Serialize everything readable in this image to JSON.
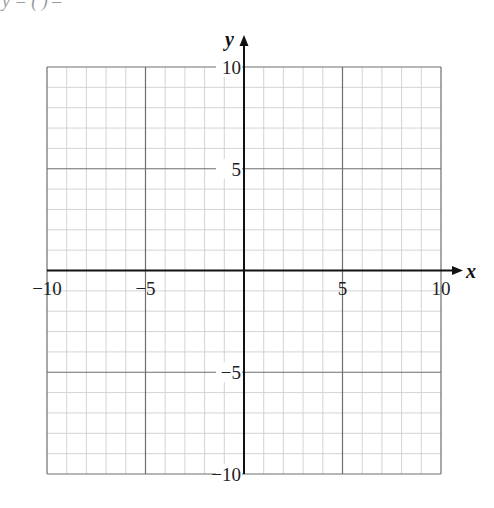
{
  "header": {
    "cropped_text": "y  =   ( )   –  "
  },
  "chart_data": {
    "type": "scatter",
    "title": "",
    "xlabel": "x",
    "ylabel": "y",
    "xlim": [
      -10,
      10
    ],
    "ylim": [
      -10,
      10
    ],
    "grid": true,
    "grid_minor_step": 1,
    "grid_major_step": 5,
    "x_ticks": [
      -10,
      -5,
      5,
      10
    ],
    "y_ticks": [
      10,
      5,
      -5,
      -10
    ],
    "x_tick_labels": [
      "−10",
      "−5",
      "5",
      "10"
    ],
    "y_tick_labels": [
      "10",
      "5",
      "−5",
      "−10"
    ],
    "series": [],
    "colors": {
      "minor_grid": "#cfcfcf",
      "major_grid": "#6e6e6e",
      "axis": "#111111"
    }
  }
}
